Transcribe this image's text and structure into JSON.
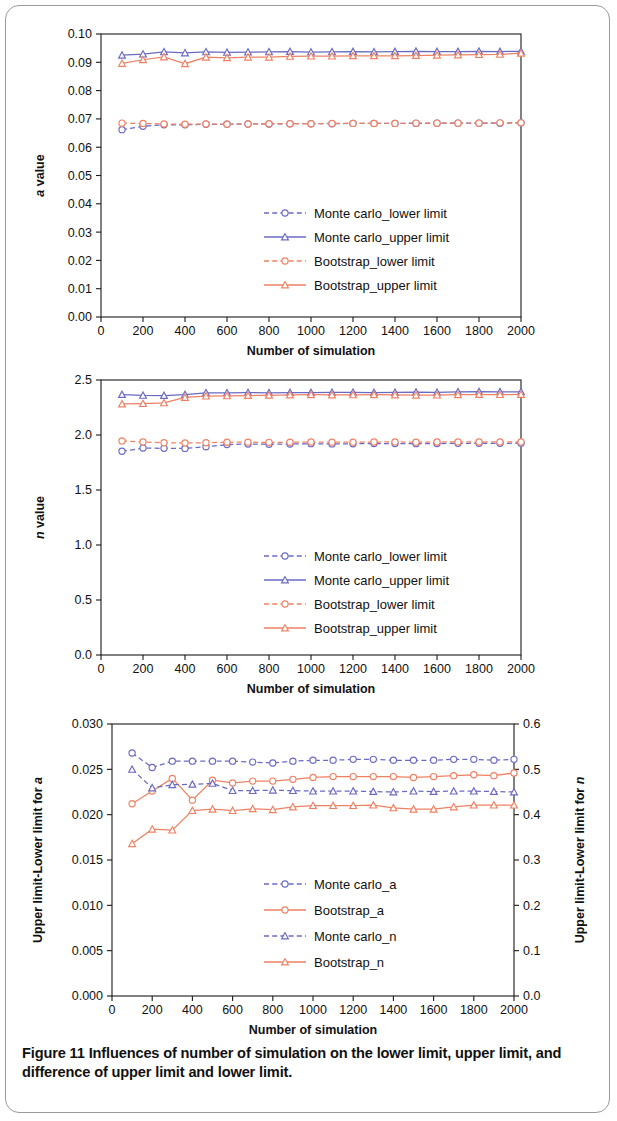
{
  "figure": {
    "caption_lead": "Figure 11",
    "caption_text": "Influences of number of simulation on the lower limit, upper limit, and difference of upper limit and lower limit.",
    "caption_full": "Figure 11 Influences of number of simulation on the lower limit, upper limit, and difference of upper limit and lower limit."
  },
  "colors": {
    "monte_carlo": "#6a6ac4",
    "bootstrap": "#ef8163",
    "axis": "#1a1a1a",
    "text": "#111111",
    "frame_border": "#9a9a9a"
  },
  "chart_data": [
    {
      "id": "panel-a",
      "type": "line",
      "title": "",
      "xlabel": "Number of simulation",
      "ylabel": "a value",
      "ylabel_italic_prefix": "a",
      "ylabel_rest": " value",
      "xlim": [
        0,
        2000
      ],
      "ylim": [
        0.0,
        0.1
      ],
      "xticks": [
        0,
        200,
        400,
        600,
        800,
        1000,
        1200,
        1400,
        1600,
        1800,
        2000
      ],
      "yticks": [
        0.0,
        0.01,
        0.02,
        0.03,
        0.04,
        0.05,
        0.06,
        0.07,
        0.08,
        0.09,
        0.1
      ],
      "ytick_labels": [
        "0.00",
        "0.01",
        "0.02",
        "0.03",
        "0.04",
        "0.05",
        "0.06",
        "0.07",
        "0.08",
        "0.09",
        "0.10"
      ],
      "xtick_labels": [
        "0",
        "200",
        "400",
        "600",
        "800",
        "1000",
        "1200",
        "1400",
        "1600",
        "1800",
        "2000"
      ],
      "grid": false,
      "legend_position": "center",
      "x": [
        100,
        200,
        300,
        400,
        500,
        600,
        700,
        800,
        900,
        1000,
        1100,
        1200,
        1300,
        1400,
        1500,
        1600,
        1700,
        1800,
        1900,
        2000
      ],
      "series": [
        {
          "name": "Monte carlo_lower limit",
          "color": "#6a6ac4",
          "dash": true,
          "marker": "circle",
          "values": [
            0.0662,
            0.0674,
            0.0679,
            0.0679,
            0.0681,
            0.0681,
            0.0682,
            0.0682,
            0.0683,
            0.0683,
            0.0683,
            0.0684,
            0.0684,
            0.0684,
            0.0684,
            0.0685,
            0.0685,
            0.0685,
            0.0685,
            0.0686
          ]
        },
        {
          "name": "Monte carlo_upper limit",
          "color": "#6a6ac4",
          "dash": false,
          "marker": "triangle",
          "values": [
            0.0925,
            0.0929,
            0.0937,
            0.0933,
            0.0937,
            0.0935,
            0.0936,
            0.0937,
            0.0938,
            0.0936,
            0.0937,
            0.0938,
            0.0937,
            0.0938,
            0.0939,
            0.0938,
            0.0938,
            0.0939,
            0.0938,
            0.0939
          ]
        },
        {
          "name": "Bootstrap_lower limit",
          "color": "#ef8163",
          "dash": true,
          "marker": "circle",
          "values": [
            0.0685,
            0.0684,
            0.0682,
            0.0681,
            0.0682,
            0.0681,
            0.0682,
            0.0683,
            0.0683,
            0.0683,
            0.0684,
            0.0684,
            0.0684,
            0.0684,
            0.0685,
            0.0685,
            0.0685,
            0.0685,
            0.0686,
            0.0686
          ]
        },
        {
          "name": "Bootstrap_upper limit",
          "color": "#ef8163",
          "dash": false,
          "marker": "triangle",
          "values": [
            0.0896,
            0.0909,
            0.0919,
            0.0895,
            0.0918,
            0.0916,
            0.0918,
            0.0918,
            0.0921,
            0.0922,
            0.0922,
            0.0923,
            0.0923,
            0.0923,
            0.0924,
            0.0925,
            0.0926,
            0.0927,
            0.0928,
            0.0932
          ]
        }
      ]
    },
    {
      "id": "panel-b",
      "type": "line",
      "title": "",
      "xlabel": "Number of simulation",
      "ylabel": "n value",
      "ylabel_italic_prefix": "n",
      "ylabel_rest": " value",
      "xlim": [
        0,
        2000
      ],
      "ylim": [
        0.0,
        2.5
      ],
      "xticks": [
        0,
        200,
        400,
        600,
        800,
        1000,
        1200,
        1400,
        1600,
        1800,
        2000
      ],
      "yticks": [
        0.0,
        0.5,
        1.0,
        1.5,
        2.0,
        2.5
      ],
      "ytick_labels": [
        "0.0",
        "0.5",
        "1.0",
        "1.5",
        "2.0",
        "2.5"
      ],
      "xtick_labels": [
        "0",
        "200",
        "400",
        "600",
        "800",
        "1000",
        "1200",
        "1400",
        "1600",
        "1800",
        "2000"
      ],
      "grid": false,
      "legend_position": "center",
      "x": [
        100,
        200,
        300,
        400,
        500,
        600,
        700,
        800,
        900,
        1000,
        1100,
        1200,
        1300,
        1400,
        1500,
        1600,
        1700,
        1800,
        1900,
        2000
      ],
      "series": [
        {
          "name": "Monte carlo_lower limit",
          "color": "#6a6ac4",
          "dash": true,
          "marker": "circle",
          "values": [
            1.852,
            1.881,
            1.879,
            1.878,
            1.893,
            1.913,
            1.918,
            1.916,
            1.918,
            1.921,
            1.919,
            1.92,
            1.922,
            1.923,
            1.921,
            1.922,
            1.924,
            1.925,
            1.924,
            1.926
          ]
        },
        {
          "name": "Monte carlo_upper limit",
          "color": "#6a6ac4",
          "dash": false,
          "marker": "triangle",
          "values": [
            2.368,
            2.36,
            2.359,
            2.367,
            2.383,
            2.383,
            2.385,
            2.384,
            2.386,
            2.386,
            2.387,
            2.388,
            2.386,
            2.387,
            2.39,
            2.388,
            2.392,
            2.395,
            2.393,
            2.392
          ]
        },
        {
          "name": "Bootstrap_lower limit",
          "color": "#ef8163",
          "dash": true,
          "marker": "circle",
          "values": [
            1.946,
            1.936,
            1.93,
            1.927,
            1.93,
            1.934,
            1.935,
            1.933,
            1.934,
            1.936,
            1.935,
            1.935,
            1.936,
            1.937,
            1.935,
            1.936,
            1.937,
            1.936,
            1.937,
            1.937
          ]
        },
        {
          "name": "Bootstrap_upper limit",
          "color": "#ef8163",
          "dash": false,
          "marker": "triangle",
          "values": [
            2.282,
            2.285,
            2.292,
            2.341,
            2.354,
            2.356,
            2.359,
            2.361,
            2.364,
            2.366,
            2.364,
            2.365,
            2.366,
            2.364,
            2.362,
            2.363,
            2.366,
            2.368,
            2.367,
            2.369
          ]
        }
      ]
    },
    {
      "id": "panel-c",
      "type": "line",
      "title": "",
      "xlabel": "Number of simulation",
      "ylabel_left": "Upper limit-Lower limit for a",
      "ylabel_left_rest": "Upper limit-Lower limit for ",
      "ylabel_left_italic": "a",
      "ylabel_right": "Upper limit-Lower limit for n",
      "ylabel_right_rest": "Upper limit-Lower limit for ",
      "ylabel_right_italic": "n",
      "xlim": [
        0,
        2000
      ],
      "ylim_left": [
        0.0,
        0.03
      ],
      "ylim_right": [
        0.0,
        0.6
      ],
      "xticks": [
        0,
        200,
        400,
        600,
        800,
        1000,
        1200,
        1400,
        1600,
        1800,
        2000
      ],
      "yticks_left": [
        0.0,
        0.005,
        0.01,
        0.015,
        0.02,
        0.025,
        0.03
      ],
      "ytick_labels_left": [
        "0.000",
        "0.005",
        "0.010",
        "0.015",
        "0.020",
        "0.025",
        "0.030"
      ],
      "yticks_right": [
        0.0,
        0.1,
        0.2,
        0.3,
        0.4,
        0.5,
        0.6
      ],
      "ytick_labels_right": [
        "0.0",
        "0.1",
        "0.2",
        "0.3",
        "0.4",
        "0.5",
        "0.6"
      ],
      "xtick_labels": [
        "0",
        "200",
        "400",
        "600",
        "800",
        "1000",
        "1200",
        "1400",
        "1600",
        "1800",
        "2000"
      ],
      "grid": false,
      "legend_position": "center",
      "x": [
        100,
        200,
        300,
        400,
        500,
        600,
        700,
        800,
        900,
        1000,
        1100,
        1200,
        1300,
        1400,
        1500,
        1600,
        1700,
        1800,
        1900,
        2000
      ],
      "series": [
        {
          "name": "Monte carlo_a",
          "color": "#6a6ac4",
          "dash": true,
          "marker": "circle",
          "axis": "left",
          "values": [
            0.0268,
            0.0252,
            0.0259,
            0.0259,
            0.0259,
            0.0259,
            0.0258,
            0.0257,
            0.0259,
            0.026,
            0.026,
            0.0261,
            0.0261,
            0.026,
            0.026,
            0.026,
            0.0261,
            0.0261,
            0.026,
            0.0261
          ]
        },
        {
          "name": "Bootstrap_a",
          "color": "#ef8163",
          "dash": false,
          "marker": "circle",
          "axis": "left",
          "values": [
            0.0212,
            0.0226,
            0.024,
            0.0216,
            0.0238,
            0.0235,
            0.0237,
            0.0237,
            0.0239,
            0.0241,
            0.0242,
            0.0242,
            0.0242,
            0.0242,
            0.0241,
            0.0242,
            0.0243,
            0.0244,
            0.0243,
            0.0246
          ]
        },
        {
          "name": "Monte carlo_n",
          "color": "#6a6ac4",
          "dash": true,
          "marker": "triangle",
          "axis": "right",
          "values": [
            0.5,
            0.459,
            0.466,
            0.467,
            0.469,
            0.453,
            0.453,
            0.454,
            0.453,
            0.452,
            0.452,
            0.452,
            0.451,
            0.45,
            0.452,
            0.451,
            0.452,
            0.452,
            0.451,
            0.45
          ]
        },
        {
          "name": "Bootstrap_n",
          "color": "#ef8163",
          "dash": false,
          "marker": "triangle",
          "axis": "right",
          "values": [
            0.336,
            0.368,
            0.366,
            0.409,
            0.412,
            0.409,
            0.413,
            0.411,
            0.417,
            0.42,
            0.42,
            0.42,
            0.421,
            0.415,
            0.412,
            0.412,
            0.417,
            0.421,
            0.421,
            0.421
          ]
        }
      ]
    }
  ]
}
